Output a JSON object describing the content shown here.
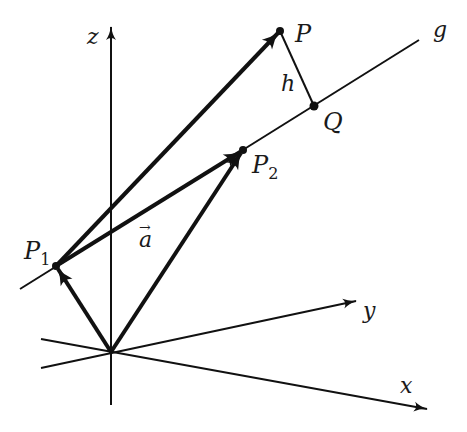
{
  "figure": {
    "colors": {
      "stroke": "#111111",
      "background": "#ffffff"
    }
  },
  "axes": {
    "origin": {
      "x": 111,
      "y": 352
    },
    "z": {
      "label": "z",
      "tip": {
        "x": 111,
        "y": 25
      },
      "tail": {
        "x": 111,
        "y": 405
      }
    },
    "y": {
      "label": "y",
      "tip": {
        "x": 357,
        "y": 301
      },
      "tail": {
        "x": 41,
        "y": 368
      }
    },
    "x": {
      "label": "x",
      "tip": {
        "x": 428,
        "y": 409
      },
      "tail": {
        "x": 41,
        "y": 339
      }
    }
  },
  "line_g": {
    "label": "g",
    "start": {
      "x": 20,
      "y": 289
    },
    "end": {
      "x": 419,
      "y": 40
    }
  },
  "points": {
    "P1": {
      "label": "P",
      "subscript": "1",
      "x": 56,
      "y": 266
    },
    "P2": {
      "label": "P",
      "subscript": "2",
      "x": 243,
      "y": 150
    },
    "P": {
      "label": "P",
      "x": 280,
      "y": 31
    },
    "Q": {
      "label": "Q",
      "x": 314,
      "y": 106
    }
  },
  "vectors": [
    {
      "name": "origin-to-P1",
      "from": "O",
      "to": "P1"
    },
    {
      "name": "origin-to-P2",
      "from": "O",
      "to": "P2"
    },
    {
      "name": "P1-to-P2",
      "from": "P1",
      "to": "P2",
      "label": "a"
    },
    {
      "name": "P1-to-P",
      "from": "P1",
      "to": "P"
    }
  ],
  "segments": [
    {
      "name": "distance-h",
      "from": "P",
      "to": "Q",
      "label": "h"
    }
  ],
  "labels": {
    "z": "z",
    "y": "y",
    "x": "x",
    "g": "g",
    "P": "P",
    "Q": "Q",
    "P1_main": "P",
    "P1_sub": "1",
    "P2_main": "P",
    "P2_sub": "2",
    "a": "a",
    "a_arrow": "→",
    "h": "h"
  }
}
